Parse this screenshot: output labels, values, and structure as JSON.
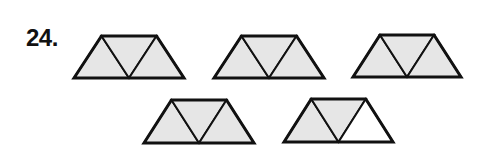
{
  "problem": {
    "number_label": "24."
  },
  "colors": {
    "shaded": "#e6e6e6",
    "unshaded": "#ffffff",
    "stroke": "#111111"
  },
  "figures": [
    {
      "id": "trapezoid-1",
      "x": 74,
      "y": 36,
      "width": 110,
      "height": 42,
      "shaded": [
        true,
        true,
        true
      ]
    },
    {
      "id": "trapezoid-2",
      "x": 214,
      "y": 36,
      "width": 110,
      "height": 42,
      "shaded": [
        true,
        true,
        true
      ]
    },
    {
      "id": "trapezoid-3",
      "x": 353,
      "y": 35,
      "width": 108,
      "height": 42,
      "shaded": [
        true,
        true,
        true
      ]
    },
    {
      "id": "trapezoid-4",
      "x": 144,
      "y": 100,
      "width": 110,
      "height": 43,
      "shaded": [
        true,
        true,
        true
      ]
    },
    {
      "id": "trapezoid-5",
      "x": 284,
      "y": 99,
      "width": 109,
      "height": 43,
      "shaded": [
        true,
        true,
        false
      ]
    }
  ]
}
